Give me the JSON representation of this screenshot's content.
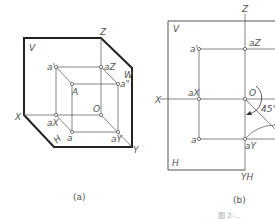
{
  "figure_a": {
    "caption": "(a)",
    "planes": {
      "V": "V",
      "W": "W",
      "H": "H"
    },
    "axes": {
      "X": "X",
      "Y": "Y",
      "Z": "Z"
    },
    "points": {
      "a_prime": "a'",
      "a_z": "aZ",
      "a_dprime": "a\"",
      "A": "A",
      "O": "O",
      "a_x": "aX",
      "a": "a",
      "a_y": "aY"
    }
  },
  "figure_b": {
    "caption": "(b)",
    "planes": {
      "V": "V",
      "H": "H"
    },
    "axes": {
      "X": "X",
      "Z": "Z",
      "Y_H": "YH",
      "Y_W": "YW"
    },
    "points": {
      "a_prime": "a'",
      "a_z": "aZ",
      "a_x": "aX",
      "O": "O",
      "a": "a",
      "a_y": "aY"
    },
    "angle": "45°"
  },
  "footer": "图 2-..."
}
